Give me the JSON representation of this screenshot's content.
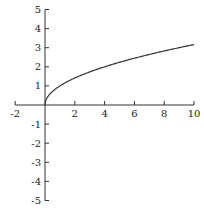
{
  "chart_data": {
    "type": "line",
    "title": "",
    "xlabel": "",
    "ylabel": "",
    "function": "y = sqrt(x)",
    "xlim": [
      -2,
      10
    ],
    "ylim": [
      -5,
      5
    ],
    "grid": false,
    "legend": null,
    "x_ticks": [
      -2,
      2,
      4,
      6,
      8,
      10
    ],
    "x_tick_labels": [
      "-2",
      "2",
      "4",
      "6",
      "8",
      "10"
    ],
    "y_ticks": [
      -5,
      -4,
      -3,
      -2,
      -1,
      1,
      2,
      3,
      4,
      5
    ],
    "y_tick_labels": [
      "-5",
      "-4",
      "-3",
      "-2",
      "-1",
      "1",
      "2",
      "3",
      "4",
      "5"
    ],
    "series": [
      {
        "name": "sqrt(x)",
        "x": [
          0,
          0.25,
          0.5,
          1,
          2,
          3,
          4,
          5,
          6,
          7,
          8,
          9,
          10
        ],
        "y": [
          0,
          0.5,
          0.71,
          1,
          1.41,
          1.73,
          2,
          2.24,
          2.45,
          2.65,
          2.83,
          3,
          3.16
        ]
      }
    ],
    "colors": {
      "axis": "#333333",
      "curve": "#333333"
    }
  }
}
